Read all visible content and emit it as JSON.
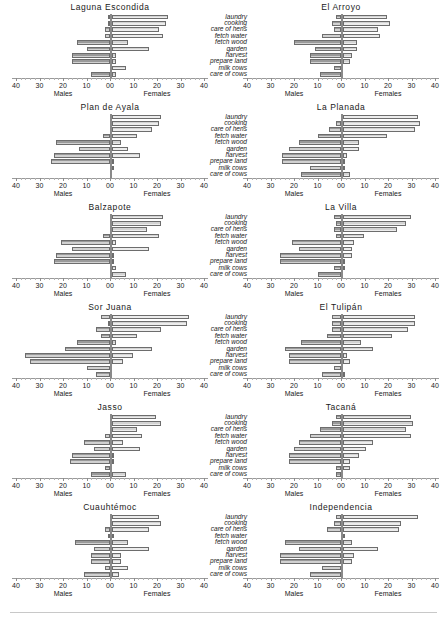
{
  "figure": {
    "activities": [
      "laundry",
      "cooking",
      "care of hens",
      "fetch water",
      "fetch wood",
      "garden",
      "harvest",
      "prepare land",
      "milk cows",
      "care of cows"
    ],
    "axis": {
      "left_label": "Males",
      "right_label": "Females",
      "tick_labels": [
        "40",
        "30",
        "20",
        "10",
        "00",
        "10",
        "20",
        "30",
        "40"
      ],
      "tick_values": [
        -40,
        -30,
        -20,
        -10,
        0,
        10,
        20,
        30,
        40
      ],
      "min": -40,
      "max": 40
    },
    "colors": {
      "male_bar": "#9a9a9a",
      "female_bar": "#d3d3d3",
      "bar_border": "#6d6d6d",
      "axis": "#8a8a8a",
      "text": "#1a1a1a"
    }
  },
  "chart_data": {
    "type": "bar",
    "subtype": "diverging population pyramid (back-to-back bars)",
    "xlabel": "Males / Females",
    "ylabel": "",
    "xlim": [
      -40,
      40
    ],
    "grid": false,
    "legend": [
      "Males",
      "Females"
    ],
    "categories": [
      "laundry",
      "cooking",
      "care of hens",
      "fetch water",
      "fetch wood",
      "garden",
      "harvest",
      "prepare land",
      "milk cows",
      "care of cows"
    ],
    "panels": [
      {
        "title": "Laguna Escondida",
        "row": 1,
        "column": "left",
        "series": [
          {
            "name": "Males",
            "values": [
              1,
              1,
              2,
              2,
              14,
              10,
              16,
              16,
              0,
              8
            ]
          },
          {
            "name": "Females",
            "values": [
              24,
              23,
              20,
              22,
              7,
              16,
              2,
              2,
              6,
              2
            ]
          }
        ]
      },
      {
        "title": "El Arroyo",
        "row": 1,
        "column": "right",
        "series": [
          {
            "name": "Males",
            "values": [
              2,
              4,
              3,
              8,
              20,
              11,
              13,
              13,
              3,
              9
            ]
          },
          {
            "name": "Females",
            "values": [
              19,
              20,
              15,
              16,
              6,
              6,
              4,
              3,
              0,
              0
            ]
          }
        ]
      },
      {
        "title": "Plan de Ayala",
        "row": 2,
        "column": "left",
        "series": [
          {
            "name": "Males",
            "values": [
              0,
              0,
              0,
              3,
              23,
              13,
              24,
              25,
              0,
              0
            ]
          },
          {
            "name": "Females",
            "values": [
              21,
              20,
              17,
              11,
              4,
              7,
              12,
              1,
              1,
              0
            ]
          }
        ]
      },
      {
        "title": "La Planada",
        "row": 2,
        "column": "right",
        "series": [
          {
            "name": "Males",
            "values": [
              0,
              2,
              5,
              10,
              18,
              22,
              25,
              25,
              13,
              17
            ]
          },
          {
            "name": "Females",
            "values": [
              32,
              33,
              31,
              19,
              7,
              7,
              2,
              1,
              1,
              3
            ]
          }
        ]
      },
      {
        "title": "Balzapote",
        "row": 3,
        "column": "left",
        "series": [
          {
            "name": "Males",
            "values": [
              0,
              0,
              0,
              3,
              21,
              16,
              23,
              24,
              0,
              0
            ]
          },
          {
            "name": "Females",
            "values": [
              22,
              21,
              15,
              20,
              2,
              16,
              1,
              1,
              2,
              6
            ]
          }
        ]
      },
      {
        "title": "La Villa",
        "row": 3,
        "column": "right",
        "series": [
          {
            "name": "Males",
            "values": [
              3,
              2,
              3,
              2,
              21,
              18,
              26,
              26,
              3,
              10
            ]
          },
          {
            "name": "Females",
            "values": [
              29,
              27,
              23,
              9,
              5,
              4,
              4,
              1,
              1,
              0
            ]
          }
        ]
      },
      {
        "title": "Sor Juana",
        "row": 4,
        "column": "left",
        "series": [
          {
            "name": "Males",
            "values": [
              4,
              1,
              6,
              4,
              14,
              19,
              36,
              34,
              10,
              6
            ]
          },
          {
            "name": "Females",
            "values": [
              33,
              32,
              21,
              11,
              2,
              17,
              9,
              5,
              0,
              0
            ]
          }
        ]
      },
      {
        "title": "El Tulipán",
        "row": 4,
        "column": "right",
        "series": [
          {
            "name": "Males",
            "values": [
              4,
              4,
              4,
              6,
              17,
              24,
              22,
              22,
              3,
              8
            ]
          },
          {
            "name": "Females",
            "values": [
              31,
              31,
              28,
              21,
              8,
              13,
              2,
              3,
              0,
              1
            ]
          }
        ]
      },
      {
        "title": "Jasso",
        "row": 5,
        "column": "left",
        "series": [
          {
            "name": "Males",
            "values": [
              0,
              0,
              0,
              2,
              11,
              7,
              16,
              17,
              2,
              8
            ]
          },
          {
            "name": "Females",
            "values": [
              19,
              21,
              11,
              13,
              5,
              12,
              1,
              1,
              0,
              6
            ]
          }
        ]
      },
      {
        "title": "Tacaná",
        "row": 5,
        "column": "right",
        "series": [
          {
            "name": "Males",
            "values": [
              2,
              4,
              9,
              13,
              18,
              20,
              22,
              22,
              2,
              2
            ]
          },
          {
            "name": "Females",
            "values": [
              29,
              30,
              27,
              29,
              13,
              10,
              7,
              3,
              3,
              0
            ]
          }
        ]
      },
      {
        "title": "Cuauhtémoc",
        "row": 6,
        "column": "left",
        "series": [
          {
            "name": "Males",
            "values": [
              0,
              0,
              2,
              1,
              15,
              7,
              8,
              8,
              2,
              11
            ]
          },
          {
            "name": "Females",
            "values": [
              20,
              21,
              16,
              1,
              7,
              16,
              4,
              4,
              7,
              3
            ]
          }
        ]
      },
      {
        "title": "Independencia",
        "row": 6,
        "column": "right",
        "series": [
          {
            "name": "Males",
            "values": [
              2,
              3,
              6,
              0,
              24,
              18,
              26,
              26,
              8,
              13
            ]
          },
          {
            "name": "Females",
            "values": [
              32,
              25,
              24,
              1,
              4,
              15,
              5,
              4,
              0,
              0
            ]
          }
        ]
      }
    ]
  }
}
